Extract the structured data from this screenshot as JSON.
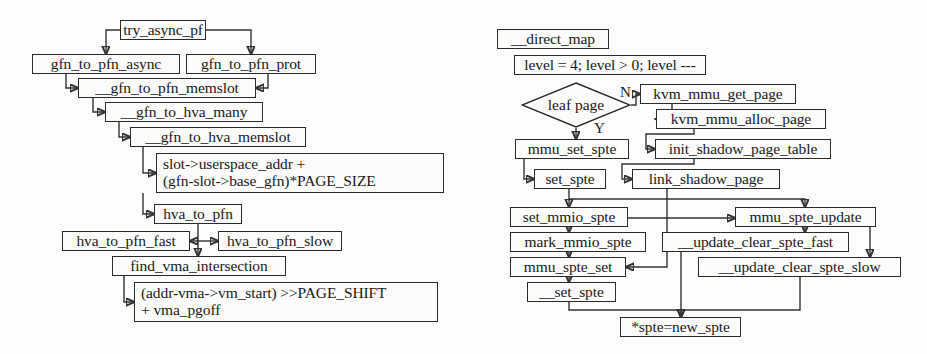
{
  "diagram": {
    "type": "flowchart",
    "panels": [
      {
        "id": "left",
        "name": "gfn-to-pfn-translation-flow",
        "nodes": [
          {
            "id": "try_async_pf",
            "label": "try_async_pf",
            "shape": "box",
            "x": 120,
            "y": 20,
            "w": 86,
            "h": 20
          },
          {
            "id": "gfn_to_pfn_async",
            "label": "gfn_to_pfn_async",
            "shape": "box",
            "x": 32,
            "y": 54,
            "w": 148,
            "h": 20
          },
          {
            "id": "gfn_to_pfn_prot",
            "label": "gfn_to_pfn_prot",
            "shape": "box",
            "x": 186,
            "y": 54,
            "w": 130,
            "h": 20
          },
          {
            "id": "__gfn_to_pfn_memslot",
            "label": "__gfn_to_pfn_memslot",
            "shape": "box",
            "x": 78,
            "y": 78,
            "w": 178,
            "h": 20
          },
          {
            "id": "__gfn_to_hva_many",
            "label": "__gfn_to_hva_many",
            "shape": "box",
            "x": 105,
            "y": 102,
            "w": 158,
            "h": 20
          },
          {
            "id": "__gfn_to_hva_memslot",
            "label": "__gfn_to_hva_memslot",
            "shape": "box",
            "x": 130,
            "y": 127,
            "w": 176,
            "h": 20
          },
          {
            "id": "slot_expr",
            "label": "slot->userspace_addr +\n(gfn-slot->base_gfn)*PAGE_SIZE",
            "shape": "box",
            "x": 156,
            "y": 153,
            "w": 288,
            "h": 40
          },
          {
            "id": "hva_to_pfn",
            "label": "hva_to_pfn",
            "shape": "box",
            "x": 154,
            "y": 204,
            "w": 88,
            "h": 20
          },
          {
            "id": "hva_to_pfn_fast",
            "label": "hva_to_pfn_fast",
            "shape": "box",
            "x": 62,
            "y": 231,
            "w": 128,
            "h": 20
          },
          {
            "id": "hva_to_pfn_slow",
            "label": "hva_to_pfn_slow",
            "shape": "box",
            "x": 218,
            "y": 231,
            "w": 124,
            "h": 20
          },
          {
            "id": "find_vma_intersection",
            "label": "find_vma_intersection",
            "shape": "box",
            "x": 112,
            "y": 256,
            "w": 174,
            "h": 20
          },
          {
            "id": "addr_expr",
            "label": "(addr-vma->vm_start) >>PAGE_SHIFT\n+ vma_pgoff",
            "shape": "box",
            "x": 134,
            "y": 282,
            "w": 304,
            "h": 40
          }
        ],
        "edges": [
          {
            "from": "try_async_pf",
            "to": "gfn_to_pfn_async"
          },
          {
            "from": "try_async_pf",
            "to": "gfn_to_pfn_prot"
          },
          {
            "from": "gfn_to_pfn_async",
            "to": "__gfn_to_pfn_memslot"
          },
          {
            "from": "gfn_to_pfn_prot",
            "to": "__gfn_to_pfn_memslot"
          },
          {
            "from": "__gfn_to_pfn_memslot",
            "to": "__gfn_to_hva_many"
          },
          {
            "from": "__gfn_to_hva_many",
            "to": "__gfn_to_hva_memslot"
          },
          {
            "from": "__gfn_to_hva_memslot",
            "to": "slot_expr"
          },
          {
            "from": "slot_expr",
            "to": "hva_to_pfn"
          },
          {
            "from": "hva_to_pfn",
            "to": "hva_to_pfn_fast"
          },
          {
            "from": "hva_to_pfn",
            "to": "hva_to_pfn_slow"
          },
          {
            "from": "hva_to_pfn",
            "to": "find_vma_intersection"
          },
          {
            "from": "find_vma_intersection",
            "to": "addr_expr"
          }
        ]
      },
      {
        "id": "right",
        "name": "direct-map-shadow-page-flow",
        "nodes": [
          {
            "id": "__direct_map",
            "label": "__direct_map",
            "shape": "box",
            "x": 497,
            "y": 29,
            "w": 112,
            "h": 20
          },
          {
            "id": "level_loop",
            "label": "level = 4; level > 0; level ---",
            "shape": "box",
            "x": 514,
            "y": 55,
            "w": 192,
            "h": 20
          },
          {
            "id": "leaf_page",
            "label": "leaf page",
            "shape": "diamond",
            "x": 521,
            "y": 82,
            "w": 110,
            "h": 46
          },
          {
            "id": "kvm_mmu_get_page",
            "label": "kvm_mmu_get_page",
            "shape": "box",
            "x": 640,
            "y": 84,
            "w": 156,
            "h": 20
          },
          {
            "id": "kvm_mmu_alloc_page",
            "label": "kvm_mmu_alloc_page",
            "shape": "box",
            "x": 656,
            "y": 109,
            "w": 170,
            "h": 20
          },
          {
            "id": "mmu_set_spte",
            "label": "mmu_set_spte",
            "shape": "box",
            "x": 515,
            "y": 139,
            "w": 114,
            "h": 20
          },
          {
            "id": "init_shadow_page_table",
            "label": "init_shadow_page_table",
            "shape": "box",
            "x": 655,
            "y": 139,
            "w": 176,
            "h": 20
          },
          {
            "id": "set_spte",
            "label": "set_spte",
            "shape": "box",
            "x": 534,
            "y": 169,
            "w": 72,
            "h": 20
          },
          {
            "id": "link_shadow_page",
            "label": "link_shadow_page",
            "shape": "box",
            "x": 632,
            "y": 169,
            "w": 148,
            "h": 20
          },
          {
            "id": "set_mmio_spte",
            "label": "set_mmio_spte",
            "shape": "box",
            "x": 510,
            "y": 207,
            "w": 118,
            "h": 20
          },
          {
            "id": "mmu_spte_update",
            "label": "mmu_spte_update",
            "shape": "box",
            "x": 735,
            "y": 207,
            "w": 141,
            "h": 20
          },
          {
            "id": "mark_mmio_spte",
            "label": "mark_mmio_spte",
            "shape": "box",
            "x": 510,
            "y": 232,
            "w": 136,
            "h": 20
          },
          {
            "id": "__update_clear_spte_fast",
            "label": "__update_clear_spte_fast",
            "shape": "box",
            "x": 662,
            "y": 232,
            "w": 187,
            "h": 20
          },
          {
            "id": "mmu_spte_set",
            "label": "mmu_spte_set",
            "shape": "box",
            "x": 510,
            "y": 257,
            "w": 116,
            "h": 20
          },
          {
            "id": "__update_clear_spte_slow",
            "label": "__update_clear_spte_slow",
            "shape": "box",
            "x": 698,
            "y": 257,
            "w": 203,
            "h": 20
          },
          {
            "id": "__set_spte",
            "label": "__set_spte",
            "shape": "box",
            "x": 527,
            "y": 282,
            "w": 89,
            "h": 20
          },
          {
            "id": "spte_assign",
            "label": "*spte=new_spte",
            "shape": "box",
            "x": 620,
            "y": 317,
            "w": 121,
            "h": 20
          }
        ],
        "edges": [
          {
            "from": "leaf_page",
            "to": "kvm_mmu_get_page",
            "label": "N"
          },
          {
            "from": "leaf_page",
            "to": "mmu_set_spte",
            "label": "Y"
          },
          {
            "from": "kvm_mmu_get_page",
            "to": "kvm_mmu_alloc_page"
          },
          {
            "from": "kvm_mmu_alloc_page",
            "to": "init_shadow_page_table"
          },
          {
            "from": "init_shadow_page_table",
            "to": "link_shadow_page"
          },
          {
            "from": "mmu_set_spte",
            "to": "set_spte"
          },
          {
            "from": "set_spte",
            "to": "set_mmio_spte"
          },
          {
            "from": "set_spte",
            "to": "mmu_spte_update"
          },
          {
            "from": "link_shadow_page",
            "to": "mmu_spte_set"
          },
          {
            "from": "set_mmio_spte",
            "to": "mark_mmio_spte"
          },
          {
            "from": "mark_mmio_spte",
            "to": "mmu_spte_set"
          },
          {
            "from": "mmu_spte_update",
            "to": "__update_clear_spte_fast"
          },
          {
            "from": "mmu_spte_update",
            "to": "__update_clear_spte_slow"
          },
          {
            "from": "mmu_spte_set",
            "to": "__set_spte"
          },
          {
            "from": "__set_spte",
            "to": "spte_assign"
          },
          {
            "from": "__update_clear_spte_fast",
            "to": "spte_assign"
          },
          {
            "from": "__update_clear_spte_slow",
            "to": "spte_assign"
          }
        ],
        "edge_labels": [
          {
            "id": "branch-no",
            "text": "N",
            "x": 620,
            "y": 84
          },
          {
            "id": "branch-yes",
            "text": "Y",
            "x": 594,
            "y": 120
          }
        ]
      }
    ]
  }
}
